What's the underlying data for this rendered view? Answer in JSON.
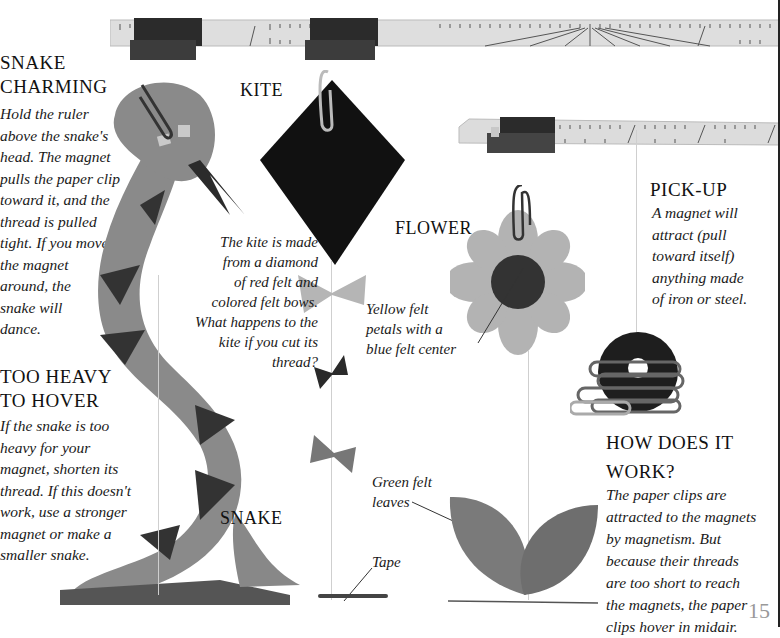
{
  "page_number": "15",
  "sections": {
    "snake_charming": {
      "heading": [
        "SNAKE",
        "CHARMING"
      ],
      "body": [
        "Hold the ruler",
        "above the snake's",
        "head. The magnet",
        "pulls the paper clip",
        "toward it, and the",
        "thread is pulled",
        "tight. If you move",
        "the magnet",
        "around, the",
        "snake will",
        "dance."
      ]
    },
    "too_heavy": {
      "heading": [
        "TOO HEAVY",
        "TO HOVER"
      ],
      "body": [
        "If the snake is too",
        "heavy for your",
        "magnet, shorten its",
        "thread. If this doesn't",
        "work, use a stronger",
        "magnet or make a",
        "smaller snake."
      ]
    },
    "pick_up": {
      "heading": "PICK-UP",
      "body": [
        "A magnet will",
        "attract (pull",
        "toward itself)",
        "anything made",
        "of iron or steel."
      ]
    },
    "how_does_it_work": {
      "heading": [
        "HOW DOES IT",
        "WORK?"
      ],
      "body": [
        "The paper clips are",
        "attracted to the magnets",
        "by magnetism. But",
        "because their threads",
        "are too short to reach",
        "the magnets, the paper",
        "clips hover in midair."
      ]
    }
  },
  "labels": {
    "kite": "KITE",
    "flower": "FLOWER",
    "snake": "SNAKE"
  },
  "captions": {
    "kite": [
      "The kite is made",
      "from a diamond",
      "of red felt and",
      "colored felt bows.",
      "What happens to the",
      "kite if you cut its",
      "thread?"
    ],
    "flower": [
      "Yellow felt",
      "petals with a",
      "blue felt center"
    ],
    "leaves": [
      "Green felt",
      "leaves"
    ],
    "tape": "Tape"
  },
  "images": {
    "ruler_top": "ruler-with-magnets",
    "ruler_right": "ruler-with-magnet",
    "snake": "felt-snake",
    "kite": "felt-kite",
    "flower": "felt-flower",
    "leaves": "felt-leaves",
    "paper_clips": "paper-clips-on-ring-magnet"
  },
  "colors": {
    "ruler": "#d9d9d9",
    "magnet": "#2e2e2e",
    "snake_felt": "#8a8a8a",
    "snake_diamonds": "#333333",
    "kite_felt": "#111111",
    "flower_petals": "#b3b3b3",
    "flower_center": "#333333",
    "leaves": "#7a7a7a"
  }
}
